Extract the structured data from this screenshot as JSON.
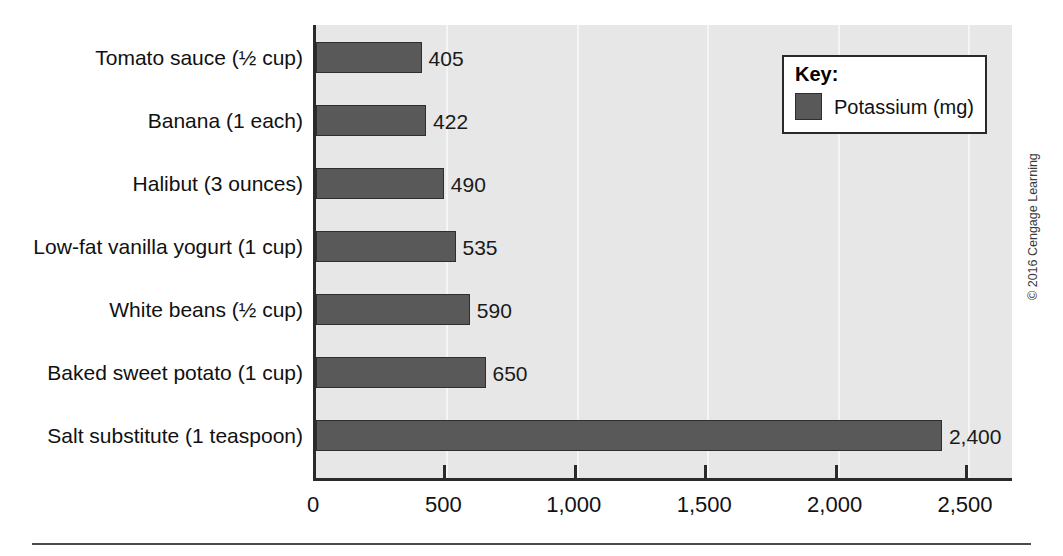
{
  "chart_data": {
    "type": "bar",
    "orientation": "horizontal",
    "title": "",
    "subtitle": "",
    "xlabel": "",
    "ylabel": "",
    "categories": [
      "Tomato sauce (½ cup)",
      "Banana (1 each)",
      "Halibut (3 ounces)",
      "Low-fat vanilla yogurt (1 cup)",
      "White beans (½ cup)",
      "Baked sweet potato (1 cup)",
      "Salt substitute (1 teaspoon)"
    ],
    "values": [
      405,
      422,
      490,
      535,
      590,
      650,
      2400
    ],
    "value_labels": [
      "405",
      "422",
      "490",
      "535",
      "590",
      "650",
      "2,400"
    ],
    "series": [
      {
        "name": "Potassium (mg)",
        "color": "#595959",
        "values": [
          405,
          422,
          490,
          535,
          590,
          650,
          2400
        ]
      }
    ],
    "xlim": [
      0,
      2600
    ],
    "xticks": [
      0,
      500,
      1000,
      1500,
      2000,
      2500
    ],
    "xtick_labels": [
      "0",
      "500",
      "1,000",
      "1,500",
      "2,000",
      "2,500"
    ],
    "grid": true,
    "grid_axis": "x",
    "legend_position": "top-right",
    "plot_background": "#e6e7e6",
    "bar_color": "#595959",
    "axis_color": "#2a2a2a"
  },
  "legend": {
    "title": "Key:",
    "entries": [
      {
        "label": "Potassium (mg)",
        "color": "#595959"
      }
    ]
  },
  "footer": {
    "copyright": "© 2016 Cengage Learning"
  }
}
